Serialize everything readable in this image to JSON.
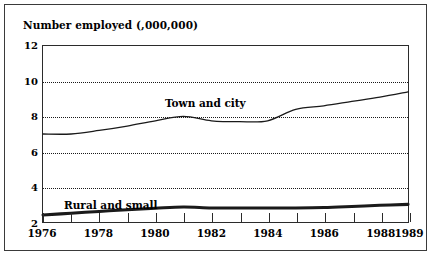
{
  "figure": {
    "title": "Number employed (,000,000)"
  },
  "chart_data": {
    "type": "line",
    "title": "Number employed (,000,000)",
    "xlabel": "",
    "ylabel": "Number employed (,000,000)",
    "xlim": [
      1976,
      1989
    ],
    "ylim": [
      2,
      12
    ],
    "yticks": [
      2,
      4,
      6,
      8,
      10,
      12
    ],
    "ytick_labels": [
      "2",
      "4",
      "6",
      "8",
      "10",
      "12"
    ],
    "gridlines_y": [
      4,
      6,
      8,
      10
    ],
    "grid": "horizontal-dotted",
    "xticks": [
      1976,
      1977,
      1978,
      1979,
      1980,
      1981,
      1982,
      1983,
      1984,
      1985,
      1986,
      1987,
      1988,
      1989
    ],
    "xtick_labels_shown": [
      "1976",
      "1978",
      "1980",
      "1982",
      "1984",
      "1986",
      "1988",
      "1989"
    ],
    "legend": "inline-annotations",
    "x": [
      1976,
      1977,
      1978,
      1979,
      1980,
      1981,
      1982,
      1983,
      1984,
      1985,
      1986,
      1987,
      1988,
      1989
    ],
    "series": [
      {
        "name": "Town and city",
        "style": "thin",
        "values": [
          7.0,
          7.0,
          7.2,
          7.45,
          7.75,
          8.0,
          7.75,
          7.7,
          7.75,
          8.4,
          8.6,
          8.85,
          9.1,
          9.4
        ]
      },
      {
        "name": "Rural and small",
        "style": "bold",
        "values": [
          2.4,
          2.5,
          2.6,
          2.7,
          2.78,
          2.85,
          2.8,
          2.8,
          2.8,
          2.8,
          2.82,
          2.88,
          2.95,
          3.0
        ]
      }
    ],
    "annotations": [
      {
        "text": "Town and city",
        "x": 1981,
        "y": 8.8
      },
      {
        "text": "Rural and small",
        "x": 1977.2,
        "y": 3.6
      }
    ]
  },
  "colors": {
    "ink": "#1a1a1a",
    "frame": "#3a3a3a",
    "background": "#ffffff"
  }
}
